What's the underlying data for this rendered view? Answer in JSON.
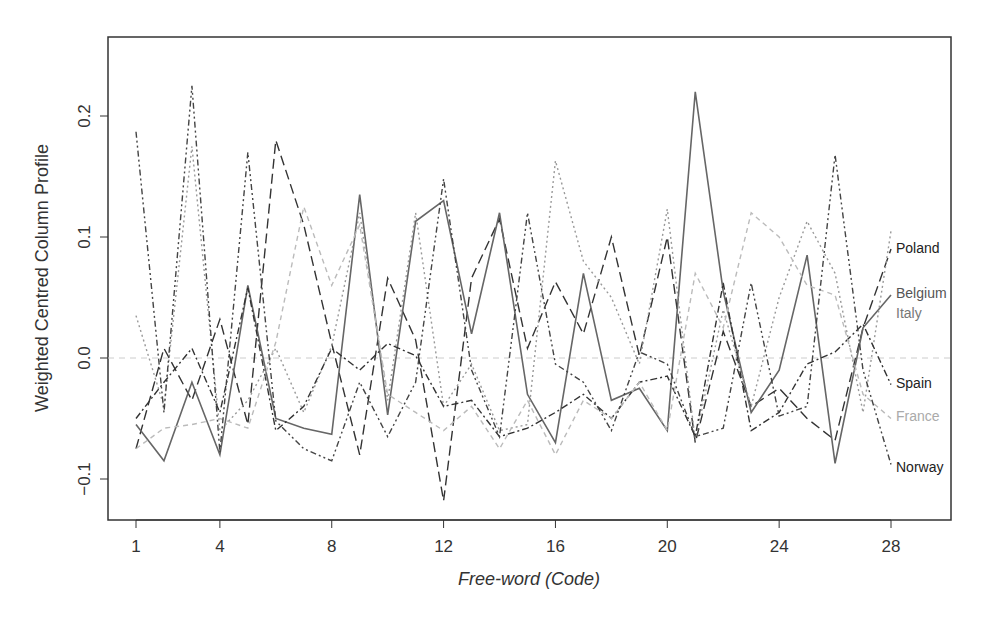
{
  "chart_data": {
    "type": "line",
    "title": "",
    "xlabel": "Free-word (Code)",
    "ylabel": "Weighted Centred Column Profile",
    "xlim": [
      0.5,
      30
    ],
    "ylim": [
      -0.135,
      0.25
    ],
    "x_ticks": [
      1,
      4,
      8,
      12,
      16,
      20,
      24,
      28
    ],
    "x_tick_labels": [
      "1",
      "4",
      "8",
      "12",
      "16",
      "20",
      "24",
      "28"
    ],
    "y_ticks": [
      -0.1,
      0.0,
      0.1,
      0.2
    ],
    "y_tick_labels": [
      "-0.1",
      "0.0",
      "0.1",
      "0.2"
    ],
    "reference_line": 0.0,
    "grid": false,
    "legend": "direct-labels-right",
    "x": [
      1,
      2,
      3,
      4,
      5,
      6,
      7,
      8,
      9,
      10,
      11,
      12,
      13,
      14,
      15,
      16,
      17,
      18,
      19,
      20,
      21,
      22,
      23,
      24,
      25,
      26,
      27,
      28
    ],
    "series": [
      {
        "name": "Poland",
        "color": "#333333",
        "dash": "long-dash",
        "values": [
          -0.075,
          0.008,
          -0.035,
          0.032,
          -0.055,
          0.18,
          0.11,
          0.012,
          -0.08,
          0.066,
          0.015,
          -0.118,
          0.066,
          0.115,
          0.008,
          0.063,
          0.02,
          0.1,
          0.002,
          0.1,
          -0.07,
          0.022,
          -0.04,
          -0.025,
          -0.05,
          -0.068,
          0.025,
          0.09
        ]
      },
      {
        "name": "Belgium",
        "color": "#666666",
        "dash": "solid",
        "values": [
          -0.055,
          -0.085,
          -0.02,
          -0.08,
          0.06,
          -0.05,
          -0.058,
          -0.063,
          0.135,
          -0.047,
          0.113,
          0.13,
          0.02,
          0.12,
          -0.03,
          -0.07,
          0.07,
          -0.035,
          -0.025,
          -0.06,
          0.22,
          0.055,
          -0.045,
          -0.01,
          0.085,
          -0.087,
          0.025,
          0.052
        ]
      },
      {
        "name": "Italy",
        "color": "#999999",
        "dash": "dotted",
        "values": [
          0.035,
          -0.04,
          0.175,
          -0.06,
          -0.035,
          0.008,
          -0.045,
          0.01,
          0.12,
          -0.035,
          0.12,
          -0.04,
          -0.005,
          -0.06,
          -0.055,
          0.163,
          0.08,
          0.05,
          -0.005,
          0.123,
          -0.068,
          0.04,
          -0.04,
          0.05,
          0.113,
          0.07,
          -0.045,
          0.105
        ]
      },
      {
        "name": "Spain",
        "color": "#333333",
        "dash": "dash-dot",
        "values": [
          -0.05,
          -0.02,
          0.008,
          -0.045,
          0.058,
          -0.06,
          -0.04,
          0.008,
          -0.01,
          0.012,
          0.002,
          -0.04,
          -0.035,
          -0.065,
          -0.058,
          -0.045,
          -0.03,
          -0.05,
          -0.02,
          -0.015,
          -0.065,
          0.062,
          -0.06,
          -0.045,
          -0.005,
          0.005,
          0.028,
          -0.022
        ]
      },
      {
        "name": "France",
        "color": "#bbbbbb",
        "dash": "short-dash",
        "values": [
          -0.075,
          -0.058,
          -0.055,
          -0.05,
          -0.058,
          0.013,
          0.125,
          0.06,
          0.11,
          -0.03,
          -0.045,
          -0.06,
          -0.04,
          -0.075,
          -0.035,
          -0.08,
          -0.035,
          -0.05,
          -0.02,
          -0.06,
          0.07,
          0.025,
          0.12,
          0.1,
          0.06,
          0.052,
          -0.03,
          -0.05
        ]
      },
      {
        "name": "Norway",
        "color": "#444444",
        "dash": "dash-dot-dot",
        "values": [
          0.187,
          -0.045,
          0.225,
          -0.078,
          0.17,
          -0.052,
          -0.075,
          -0.085,
          -0.02,
          -0.065,
          -0.02,
          0.148,
          -0.01,
          -0.065,
          0.12,
          -0.005,
          -0.02,
          -0.06,
          0.005,
          -0.005,
          -0.065,
          -0.058,
          0.062,
          -0.048,
          -0.04,
          0.168,
          -0.01,
          -0.088
        ]
      }
    ],
    "series_label_colors": {
      "Poland": "#222222",
      "Belgium": "#555555",
      "Italy": "#777777",
      "Spain": "#222222",
      "France": "#aaaaaa",
      "Norway": "#222222"
    }
  }
}
